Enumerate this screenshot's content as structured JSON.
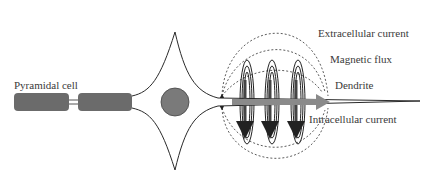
{
  "diagram": {
    "labels": {
      "pyramidal_cell": "Pyramidal cell",
      "extracellular_current": "Extracellular current",
      "magnetic_flux": "Magnetic flux",
      "dendrite": "Dendrite",
      "intracellular_current": "Intracellular current"
    },
    "colors": {
      "axon_segment": "#6b6b6b",
      "nucleus": "#7a7a7a",
      "current_arrow": "#8a8a8a",
      "outline": "#2a2a2a",
      "dashed_lines": "#333333",
      "text": "#3a3a3a"
    }
  }
}
